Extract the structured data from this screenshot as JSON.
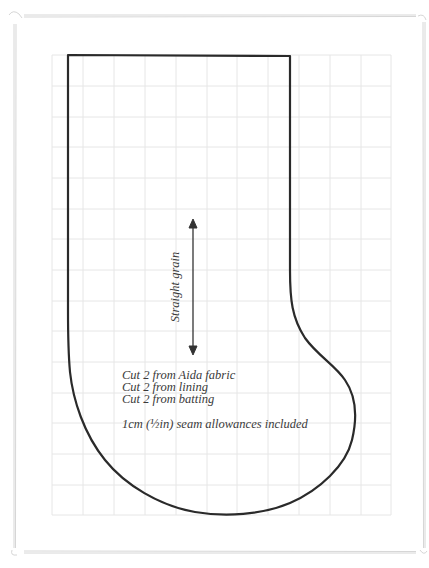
{
  "pattern": {
    "title": "Christmas stocking template",
    "grain_label": "Straight grain",
    "instructions": [
      "Cut 2 from Aida fabric",
      "Cut 2 from lining",
      "Cut 2 from batting"
    ],
    "seam_note": "1cm (½in) seam allowances included"
  },
  "grid": {
    "columns": 11,
    "rows": 15,
    "line_color": "#e4e4e4"
  },
  "colors": {
    "outline": "#2a2a2a",
    "frame": "#d8d8d8",
    "text": "#3a3a3a"
  }
}
